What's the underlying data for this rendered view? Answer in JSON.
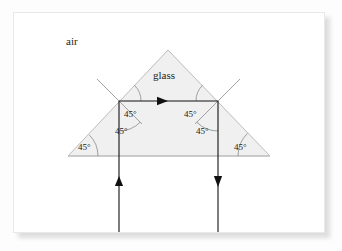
{
  "figure": {
    "type": "optics-ray-diagram",
    "background_color": "#fdfdfd",
    "page_color": "#ffffff"
  },
  "media_labels": {
    "outside": "air",
    "inside": "glass"
  },
  "prism": {
    "shape": "triangle",
    "fill_color": "#f0f0f0",
    "stroke_color": "#b9b9b9",
    "vertices": [
      {
        "name": "apex",
        "x": 168,
        "y": 50
      },
      {
        "name": "left-base",
        "x": 68,
        "y": 156
      },
      {
        "name": "right-base",
        "x": 270,
        "y": 156
      }
    ],
    "base_line": {
      "x1": 68,
      "y1": 156,
      "x2": 270,
      "y2": 156
    }
  },
  "rays": [
    {
      "name": "incident-ray",
      "direction": "up",
      "x": 119,
      "y_start": 232,
      "y_end": 101,
      "arrow_at": {
        "x": 119,
        "y": 182
      },
      "color": "#111111"
    },
    {
      "name": "internal-ray",
      "direction": "right",
      "y": 101,
      "x_start": 119,
      "x_end": 218,
      "arrow_at": {
        "x": 163,
        "y": 101
      },
      "color": "#111111"
    },
    {
      "name": "exit-ray",
      "direction": "down",
      "x": 218,
      "y_start": 101,
      "y_end": 232,
      "arrow_at": {
        "x": 218,
        "y": 181
      },
      "color": "#111111"
    }
  ],
  "normals": [
    {
      "name": "left-normal",
      "x1": 98,
      "y1": 80,
      "x2": 140,
      "y2": 122,
      "color": "#777777"
    },
    {
      "name": "right-normal",
      "x1": 239,
      "y1": 80,
      "x2": 197,
      "y2": 122,
      "color": "#777777"
    }
  ],
  "angles": [
    {
      "id": "left-vertex-angle",
      "label": "45°",
      "x": 78,
      "y": 143,
      "arc": {
        "cx": 68,
        "cy": 156,
        "r": 30,
        "a1": -45,
        "a2": 0
      }
    },
    {
      "id": "left-upper-angle",
      "label": "45°",
      "x": 122,
      "y": 112,
      "arc": {
        "cx": 119,
        "cy": 101,
        "r": 22,
        "a1": 0,
        "a2": 45
      }
    },
    {
      "id": "left-lower-angle",
      "label": "45°",
      "x": 118,
      "y": 130,
      "arc": {
        "cx": 119,
        "cy": 101,
        "r": 30,
        "a1": 45,
        "a2": 90
      }
    },
    {
      "id": "right-upper-angle",
      "label": "45°",
      "x": 188,
      "y": 112,
      "arc": {
        "cx": 218,
        "cy": 101,
        "r": 22,
        "a1": 135,
        "a2": 180
      }
    },
    {
      "id": "right-lower-angle",
      "label": "45°",
      "x": 198,
      "y": 130,
      "arc": {
        "cx": 218,
        "cy": 101,
        "r": 30,
        "a1": 90,
        "a2": 135
      }
    },
    {
      "id": "right-vertex-angle",
      "label": "45°",
      "x": 237,
      "y": 143,
      "arc": {
        "cx": 270,
        "cy": 156,
        "r": 32,
        "a1": 180,
        "a2": 225
      }
    }
  ],
  "label_positions": {
    "air": {
      "x": 66,
      "y": 36
    },
    "glass": {
      "x": 153,
      "y": 70
    }
  }
}
